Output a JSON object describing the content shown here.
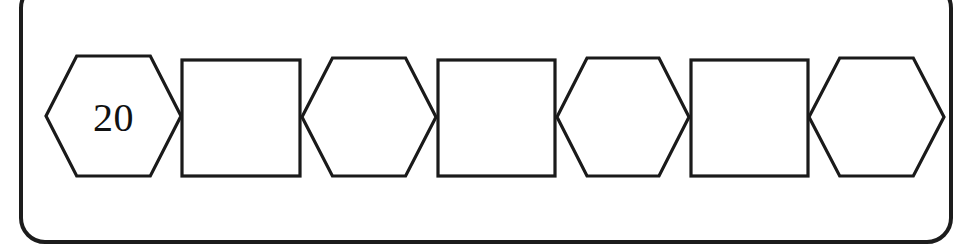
{
  "page": {
    "background_color": "#ffffff"
  },
  "frame": {
    "border_color": "#1c1c1c",
    "border_width_px": 4,
    "corner_radius_px": 26,
    "fill_color": "#ffffff",
    "top_edge_cropped": true
  },
  "sequence": {
    "stroke_color": "#1a1a1a",
    "fill_color": "#ffffff",
    "orientation": "horizontal",
    "shapes": [
      {
        "index": 1,
        "type": "hexagon",
        "label": "20",
        "filled_in": true,
        "x": 44,
        "y": 54,
        "width": 139,
        "height": 124
      },
      {
        "index": 2,
        "type": "square",
        "label": "",
        "filled_in": false,
        "x": 180,
        "y": 58,
        "width": 122,
        "height": 120
      },
      {
        "index": 3,
        "type": "hexagon",
        "label": "",
        "filled_in": false,
        "x": 300,
        "y": 56,
        "width": 138,
        "height": 122
      },
      {
        "index": 4,
        "type": "square",
        "label": "",
        "filled_in": false,
        "x": 436,
        "y": 58,
        "width": 121,
        "height": 120
      },
      {
        "index": 5,
        "type": "hexagon",
        "label": "",
        "filled_in": false,
        "x": 555,
        "y": 56,
        "width": 136,
        "height": 122
      },
      {
        "index": 6,
        "type": "square",
        "label": "",
        "filled_in": false,
        "x": 689,
        "y": 58,
        "width": 121,
        "height": 120
      },
      {
        "index": 7,
        "type": "hexagon",
        "label": "",
        "filled_in": false,
        "x": 807,
        "y": 56,
        "width": 139,
        "height": 122
      }
    ]
  }
}
